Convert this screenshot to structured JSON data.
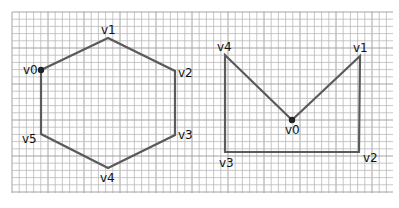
{
  "grid": {
    "x0": 12,
    "y0": 12,
    "x1": 393,
    "y1": 193,
    "cell": 7.2,
    "line_color": "#b9b9b9"
  },
  "colors": {
    "edge": "#5a5a5a",
    "vertex_dot": "#222222",
    "label": "#111111"
  },
  "figures": [
    {
      "name": "hexagon",
      "closed": true,
      "vertices": [
        {
          "label": "v0",
          "x": 41,
          "y": 70,
          "lx": 23,
          "ly": 74,
          "dot": true
        },
        {
          "label": "v1",
          "x": 108,
          "y": 38,
          "lx": 101,
          "ly": 34,
          "dot": false
        },
        {
          "label": "v2",
          "x": 175,
          "y": 71,
          "lx": 178,
          "ly": 77,
          "dot": false
        },
        {
          "label": "v3",
          "x": 175,
          "y": 135,
          "lx": 178,
          "ly": 139,
          "dot": false
        },
        {
          "label": "v4",
          "x": 108,
          "y": 168,
          "lx": 100,
          "ly": 182,
          "dot": false
        },
        {
          "label": "v5",
          "x": 41,
          "y": 134,
          "lx": 22,
          "ly": 143,
          "dot": false
        }
      ]
    },
    {
      "name": "notched-rectangle",
      "closed": true,
      "vertices": [
        {
          "label": "v0",
          "x": 292,
          "y": 120,
          "lx": 285,
          "ly": 134,
          "dot": true
        },
        {
          "label": "v1",
          "x": 360,
          "y": 56,
          "lx": 353,
          "ly": 52,
          "dot": false
        },
        {
          "label": "v2",
          "x": 359,
          "y": 152,
          "lx": 363,
          "ly": 162,
          "dot": false
        },
        {
          "label": "v3",
          "x": 225,
          "y": 152,
          "lx": 219,
          "ly": 167,
          "dot": false
        },
        {
          "label": "v4",
          "x": 225,
          "y": 55,
          "lx": 217,
          "ly": 51,
          "dot": false
        }
      ]
    }
  ]
}
